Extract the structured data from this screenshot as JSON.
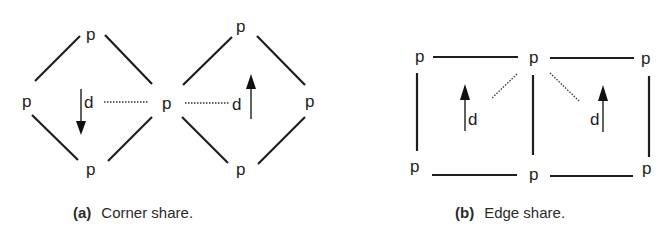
{
  "figure": {
    "node_label": "p",
    "vector_label": "d",
    "panels": [
      {
        "id": "a",
        "caption_tag": "(a)",
        "caption_text": "Corner share.",
        "description": "Two diamonds sharing a single corner node p; each has a direction vector d, linked to the shared p by a dotted line",
        "arrows": [
          "down",
          "up"
        ]
      },
      {
        "id": "b",
        "caption_tag": "(b)",
        "caption_text": "Edge share.",
        "description": "Two squares sharing a vertical edge; each has a direction vector d, linked to the top shared p by a dotted line",
        "arrows": [
          "up",
          "up"
        ]
      }
    ]
  }
}
